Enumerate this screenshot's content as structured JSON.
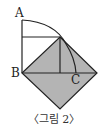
{
  "figure": {
    "caption": "〈그림 2〉",
    "labels": {
      "A": "A",
      "B": "B",
      "C": "C"
    },
    "colors": {
      "fill": "#b4b4b4",
      "stroke": "#222222"
    }
  }
}
